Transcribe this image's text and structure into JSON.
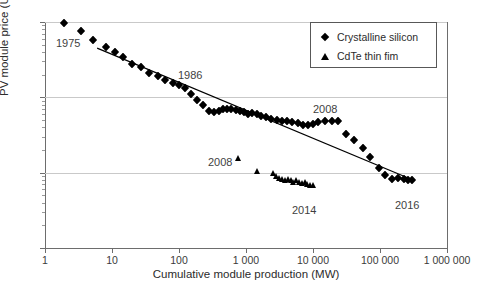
{
  "chart_data": {
    "type": "scatter",
    "title": "",
    "xlabel": "Cumulative module production (MW)",
    "ylabel": "PV module price (USD2016/Wp)",
    "ylabel_parts": {
      "pre": "PV module price (USD",
      "sub1": "2016",
      "mid": "/W",
      "sub2": "p",
      "post": ")"
    },
    "xscale": "log",
    "yscale": "log",
    "xlim": [
      1,
      1000000
    ],
    "ylim": [
      0.1,
      100
    ],
    "grid": "horizontal-major",
    "legend_position": "top-right",
    "xticks": [
      {
        "value": 1,
        "label": "1"
      },
      {
        "value": 10,
        "label": "10"
      },
      {
        "value": 100,
        "label": "100"
      },
      {
        "value": 1000,
        "label": "1 000"
      },
      {
        "value": 10000,
        "label": "10 000"
      },
      {
        "value": 100000,
        "label": "100 000"
      },
      {
        "value": 1000000,
        "label": "1 000 000"
      }
    ],
    "yticks": [
      {
        "value": 100,
        "label": "100"
      },
      {
        "value": 10,
        "label": "10"
      },
      {
        "value": 1,
        "label": "1"
      },
      {
        "value": 0.1,
        "label": "0.1"
      }
    ],
    "series": [
      {
        "name": "Crystalline silicon",
        "marker": "diamond",
        "color": "#000000",
        "points": [
          [
            1.9,
            97
          ],
          [
            3.4,
            76
          ],
          [
            5.2,
            58
          ],
          [
            8.0,
            46
          ],
          [
            11.0,
            40
          ],
          [
            14.5,
            34
          ],
          [
            20.0,
            28
          ],
          [
            27.0,
            25
          ],
          [
            36.0,
            21
          ],
          [
            48.0,
            19
          ],
          [
            62.0,
            17
          ],
          [
            80.0,
            15.5
          ],
          [
            100.0,
            14.5
          ],
          [
            125.0,
            13.2
          ],
          [
            150.0,
            11.0
          ],
          [
            185.0,
            9.2
          ],
          [
            230.0,
            7.8
          ],
          [
            280.0,
            6.6
          ],
          [
            330.0,
            6.3
          ],
          [
            390.0,
            6.6
          ],
          [
            450.0,
            7.0
          ],
          [
            520.0,
            7.1
          ],
          [
            600.0,
            7.0
          ],
          [
            700.0,
            6.8
          ],
          [
            810.0,
            6.6
          ],
          [
            940.0,
            6.3
          ],
          [
            1080.0,
            6.1
          ],
          [
            1250.0,
            6.2
          ],
          [
            1450.0,
            6.0
          ],
          [
            1700.0,
            5.6
          ],
          [
            2000.0,
            5.4
          ],
          [
            2400.0,
            5.2
          ],
          [
            2900.0,
            5.0
          ],
          [
            3400.0,
            4.9
          ],
          [
            4100.0,
            4.8
          ],
          [
            4900.0,
            4.7
          ],
          [
            5900.0,
            4.5
          ],
          [
            7000.0,
            4.3
          ],
          [
            8400.0,
            4.3
          ],
          [
            10000.0,
            4.4
          ],
          [
            12000.0,
            4.7
          ],
          [
            15000.0,
            4.8
          ],
          [
            19000.0,
            4.8
          ],
          [
            24000.0,
            4.9
          ],
          [
            31000.0,
            3.3
          ],
          [
            41000.0,
            2.7
          ],
          [
            55000.0,
            2.1
          ],
          [
            72000.0,
            1.6
          ],
          [
            95000.0,
            1.15
          ],
          [
            118000.0,
            0.92
          ],
          [
            150000.0,
            0.82
          ],
          [
            185000.0,
            0.85
          ],
          [
            225000.0,
            0.82
          ],
          [
            265000.0,
            0.8
          ],
          [
            300000.0,
            0.79
          ]
        ]
      },
      {
        "name": "CdTe thin fim",
        "marker": "triangle",
        "color": "#000000",
        "points": [
          [
            760.0,
            1.55
          ],
          [
            1500.0,
            1.05
          ],
          [
            2600.0,
            0.99
          ],
          [
            2900.0,
            0.9
          ],
          [
            3200.0,
            0.86
          ],
          [
            3500.0,
            0.83
          ],
          [
            3900.0,
            0.8
          ],
          [
            4300.0,
            0.83
          ],
          [
            4700.0,
            0.79
          ],
          [
            5200.0,
            0.76
          ],
          [
            5700.0,
            0.79
          ],
          [
            6300.0,
            0.75
          ],
          [
            6900.0,
            0.72
          ],
          [
            7600.0,
            0.75
          ],
          [
            8300.0,
            0.71
          ],
          [
            9100.0,
            0.69
          ],
          [
            10000.0,
            0.68
          ]
        ]
      }
    ],
    "trend_line": {
      "name": "experience-curve",
      "from": [
        6.0,
        45.0
      ],
      "to": [
        330000.0,
        0.78
      ]
    },
    "annotations": [
      {
        "id": "ann-1975",
        "text": "1975",
        "x_px": 56,
        "y_px": 37
      },
      {
        "id": "ann-1986",
        "text": "1986",
        "x_px": 178,
        "y_px": 69
      },
      {
        "id": "ann-2008-si",
        "text": "2008",
        "x_px": 313,
        "y_px": 103
      },
      {
        "id": "ann-2008-cdte",
        "text": "2008",
        "x_px": 208,
        "y_px": 156
      },
      {
        "id": "ann-2014",
        "text": "2014",
        "x_px": 292,
        "y_px": 204
      },
      {
        "id": "ann-2016",
        "text": "2016",
        "x_px": 395,
        "y_px": 199
      }
    ],
    "legend": [
      {
        "label": "Crystalline silicon",
        "marker": "diamond-icon"
      },
      {
        "label": "CdTe thin fim",
        "marker": "triangle-icon"
      }
    ]
  }
}
